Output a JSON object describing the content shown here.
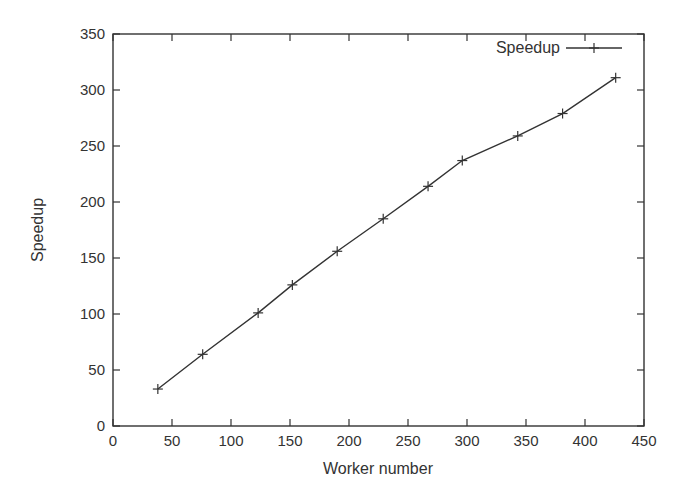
{
  "chart_data": {
    "type": "line",
    "title": "",
    "xlabel": "Worker number",
    "ylabel": "Speedup",
    "xlim": [
      0,
      450
    ],
    "ylim": [
      0,
      350
    ],
    "xticks": [
      0,
      50,
      100,
      150,
      200,
      250,
      300,
      350,
      400,
      450
    ],
    "yticks": [
      0,
      50,
      100,
      150,
      200,
      250,
      300,
      350
    ],
    "grid": false,
    "legend_position": "top-right",
    "series": [
      {
        "name": "Speedup",
        "marker": "+",
        "color": "#333333",
        "x": [
          38,
          76,
          123,
          152,
          190,
          229,
          267,
          296,
          343,
          381,
          426
        ],
        "y": [
          33,
          64,
          101,
          126,
          156,
          185,
          214,
          237,
          259,
          279,
          311
        ]
      }
    ]
  }
}
